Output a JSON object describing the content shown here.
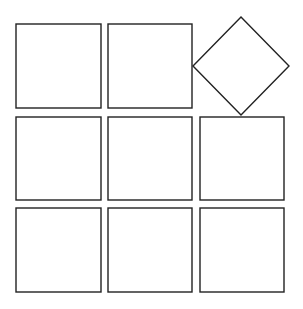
{
  "diagram": {
    "stroke_color": "#222222",
    "fill_color": "#ffffff",
    "stroke_width": 1.4,
    "squares": [
      {
        "id": "r1c1",
        "x": 16,
        "y": 24,
        "w": 85,
        "h": 84
      },
      {
        "id": "r1c2",
        "x": 108,
        "y": 24,
        "w": 84,
        "h": 84
      },
      {
        "id": "r2c1",
        "x": 16,
        "y": 117,
        "w": 85,
        "h": 83
      },
      {
        "id": "r2c2",
        "x": 108,
        "y": 117,
        "w": 84,
        "h": 83
      },
      {
        "id": "r2c3",
        "x": 200,
        "y": 117,
        "w": 84,
        "h": 83
      },
      {
        "id": "r3c1",
        "x": 16,
        "y": 208,
        "w": 85,
        "h": 84
      },
      {
        "id": "r3c2",
        "x": 108,
        "y": 208,
        "w": 84,
        "h": 84
      },
      {
        "id": "r3c3",
        "x": 200,
        "y": 208,
        "w": 84,
        "h": 84
      }
    ],
    "diamond": {
      "id": "r1c3-rotated",
      "points": "241,17 289,66 241,115 193,66"
    }
  }
}
